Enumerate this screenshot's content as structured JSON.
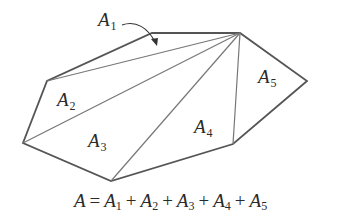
{
  "figure": {
    "stroke_color": "#555555",
    "vertices": {
      "apex": [
        240,
        33
      ],
      "top_left": [
        152,
        33
      ],
      "left_upper": [
        47,
        81
      ],
      "left_far": [
        23,
        143
      ],
      "bottom": [
        111,
        181
      ],
      "bottom_right": [
        233,
        144
      ],
      "right": [
        307,
        81
      ]
    },
    "regions": [
      {
        "name": "A",
        "sub": "1",
        "x": 98,
        "y": 26
      },
      {
        "name": "A",
        "sub": "2",
        "x": 57,
        "y": 106
      },
      {
        "name": "A",
        "sub": "3",
        "x": 88,
        "y": 147
      },
      {
        "name": "A",
        "sub": "4",
        "x": 194,
        "y": 133
      },
      {
        "name": "A",
        "sub": "5",
        "x": 258,
        "y": 83
      }
    ],
    "arrow": {
      "from": [
        122,
        26
      ],
      "to": [
        156,
        44
      ]
    }
  },
  "formula": {
    "lhs": "A",
    "equals": "=",
    "terms": [
      {
        "name": "A",
        "sub": "1"
      },
      {
        "name": "A",
        "sub": "2"
      },
      {
        "name": "A",
        "sub": "3"
      },
      {
        "name": "A",
        "sub": "4"
      },
      {
        "name": "A",
        "sub": "5"
      }
    ],
    "plus": "+"
  }
}
